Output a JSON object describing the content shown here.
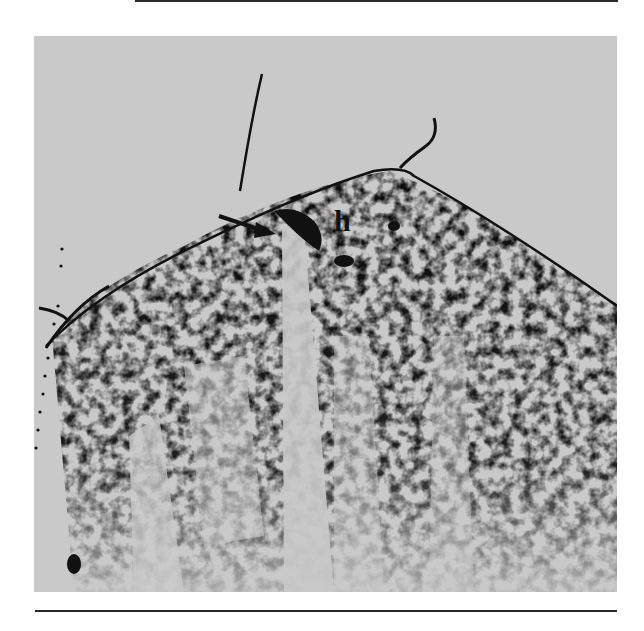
{
  "figure": {
    "type": "ultrasound-image",
    "annotation_label": "h",
    "colors": {
      "background": "#ffffff",
      "panel": "#c9c9c9",
      "ink": "#111111"
    }
  }
}
